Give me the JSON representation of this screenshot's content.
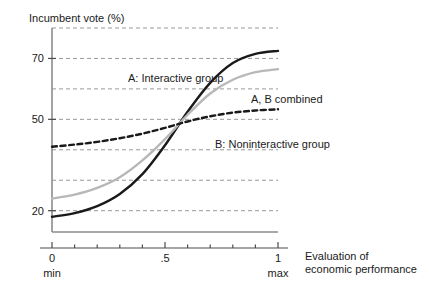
{
  "chart_data": {
    "type": "line",
    "title": "",
    "ylabel": "Incumbent vote (%)",
    "xlabel": "Evaluation of\neconomic performance",
    "xlabel_line1": "Evaluation of",
    "xlabel_line2": "economic performance",
    "xlim": [
      0,
      1
    ],
    "ylim": [
      13,
      80
    ],
    "grid": true,
    "gridlines_y": [
      80,
      70,
      60,
      50,
      40,
      30,
      20
    ],
    "ytick_labels": [
      {
        "value": 70,
        "text": "70"
      },
      {
        "value": 50,
        "text": "50"
      },
      {
        "value": 20,
        "text": "20"
      }
    ],
    "xtick_labels": [
      {
        "value": 0,
        "text": "0"
      },
      {
        "value": 0.5,
        "text": ".5"
      },
      {
        "value": 1,
        "text": "1"
      }
    ],
    "xtick_minor_step": 0.1,
    "x_endcaps": [
      {
        "value": 0,
        "text": "min"
      },
      {
        "value": 1,
        "text": "max"
      }
    ],
    "legend_position": "inline-annotations",
    "x": [
      0,
      0.1,
      0.2,
      0.3,
      0.4,
      0.5,
      0.6,
      0.7,
      0.8,
      0.9,
      1
    ],
    "series": [
      {
        "name": "A: Interactive group",
        "label": "A: Interactive group",
        "color": "#1a1a1a",
        "style": "solid",
        "width": 2.4,
        "label_x": 128,
        "label_y": 72,
        "values": [
          18.0,
          19.2,
          21.5,
          25.5,
          32.0,
          41.5,
          52.5,
          62.0,
          68.5,
          71.5,
          72.5
        ]
      },
      {
        "name": "A, B combined",
        "label": "A, B combined",
        "color": "#b8b8b8",
        "style": "solid",
        "width": 2.4,
        "label_x": 251,
        "label_y": 93,
        "values": [
          24.0,
          25.3,
          27.5,
          31.0,
          36.5,
          43.5,
          51.5,
          58.5,
          63.0,
          65.5,
          66.5
        ]
      },
      {
        "name": "B: Noninteractive group",
        "label": "B: Noninteractive group",
        "color": "#1a1a1a",
        "style": "dashed",
        "width": 2.4,
        "label_x": 215,
        "label_y": 138,
        "values": [
          41.0,
          41.7,
          42.6,
          43.8,
          45.3,
          47.2,
          49.3,
          51.0,
          52.2,
          52.9,
          53.3
        ]
      }
    ]
  },
  "axes": {
    "spine_color": "#8c8c8c",
    "grid_color": "#999999",
    "plot_left": 52,
    "plot_right": 278,
    "plot_top": 28,
    "plot_bottom": 232,
    "xaxis_line_y": 248
  }
}
